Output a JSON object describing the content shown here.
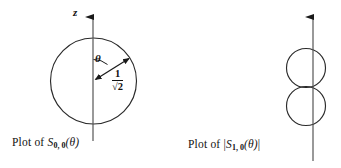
{
  "figure": {
    "width": 341,
    "height": 168,
    "background": "#ffffff",
    "ink_color": "#1a1a1a"
  },
  "left_panel": {
    "axis_label": "z",
    "angle_label": "θ",
    "radius_numerator": "1",
    "radius_denominator": "√2",
    "caption": {
      "prefix": "Plot of ",
      "symbol": "S",
      "subscript": "0, 0",
      "argument": "(θ)",
      "full_text": "Plot of S0, 0(θ)"
    },
    "shape": {
      "type": "circle",
      "center": [
        93.5,
        81
      ],
      "radius": 43
    },
    "axis": {
      "x": 93,
      "y_top": 14,
      "y_bottom": 141,
      "arrow": "up"
    },
    "radius_arrow": {
      "from": [
        93,
        81
      ],
      "to": [
        131,
        57
      ],
      "double_headed": true
    }
  },
  "right_panel": {
    "axis_label": "z",
    "sign_top": "+",
    "sign_bottom": "−",
    "caption": {
      "prefix": "Plot of ",
      "bar_open": "|",
      "symbol": "S",
      "subscript": "1, 0",
      "argument": "(θ)",
      "bar_close": "|",
      "full_text": "Plot of |S1, 0(θ)|"
    },
    "shapes": [
      {
        "type": "circle",
        "center": [
          306,
          68
        ],
        "radius": 19,
        "sign": "+"
      },
      {
        "type": "circle",
        "center": [
          306,
          106
        ],
        "radius": 19,
        "sign": "−"
      }
    ],
    "axis": {
      "x": 313,
      "y_top": 14,
      "y_bottom": 161,
      "arrow": "up"
    }
  }
}
